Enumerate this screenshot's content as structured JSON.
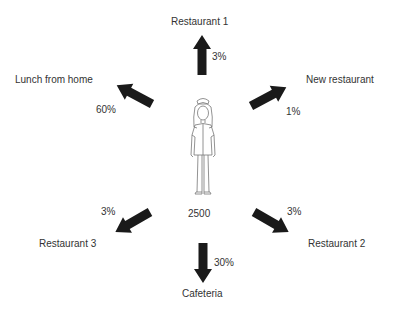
{
  "center": {
    "label": "2500",
    "figure": "nurse-figure-icon"
  },
  "destinations": [
    {
      "id": "restaurant-1",
      "name": "Restaurant 1",
      "percent": "3%"
    },
    {
      "id": "new-restaurant",
      "name": "New restaurant",
      "percent": "1%"
    },
    {
      "id": "restaurant-2",
      "name": "Restaurant 2",
      "percent": "3%"
    },
    {
      "id": "cafeteria",
      "name": "Cafeteria",
      "percent": "30%"
    },
    {
      "id": "restaurant-3",
      "name": "Restaurant 3",
      "percent": "3%"
    },
    {
      "id": "lunch-from-home",
      "name": "Lunch from home",
      "percent": "60%"
    }
  ],
  "colors": {
    "arrow": "#1a1a1a",
    "text": "#333333",
    "figure_stroke": "#777777"
  }
}
